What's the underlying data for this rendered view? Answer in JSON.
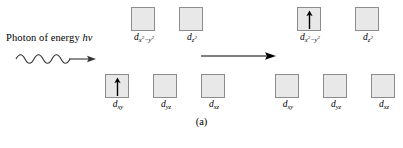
{
  "figure": {
    "caption": "(a)",
    "photon": {
      "text_plain": "Photon of energy ",
      "text_italic": "hv",
      "icon": "wavy-photon-arrow"
    },
    "reaction": {
      "icon": "right-arrow"
    },
    "colors": {
      "box_fill": "#e8e8e8",
      "box_border": "#8c8c8c",
      "ink": "#000000",
      "background": "#ffffff"
    },
    "panels": [
      {
        "name": "ground-state",
        "upper_level": [
          {
            "orbital": "d",
            "sub": "x",
            "sup1": "2",
            "dash": "−",
            "sub2": "y",
            "sup2": "2",
            "electrons": 0
          },
          {
            "orbital": "d",
            "sub": "z",
            "sup1": "2",
            "dash": "",
            "sub2": "",
            "sup2": "",
            "electrons": 0
          }
        ],
        "lower_level": [
          {
            "orbital": "d",
            "sub": "xy",
            "electrons": 1
          },
          {
            "orbital": "d",
            "sub": "yz",
            "electrons": 0
          },
          {
            "orbital": "d",
            "sub": "xz",
            "electrons": 0
          }
        ]
      },
      {
        "name": "excited-state",
        "upper_level": [
          {
            "orbital": "d",
            "sub": "x",
            "sup1": "2",
            "dash": "−",
            "sub2": "y",
            "sup2": "2",
            "electrons": 1
          },
          {
            "orbital": "d",
            "sub": "z",
            "sup1": "2",
            "dash": "",
            "sub2": "",
            "sup2": "",
            "electrons": 0
          }
        ],
        "lower_level": [
          {
            "orbital": "d",
            "sub": "xy",
            "electrons": 0
          },
          {
            "orbital": "d",
            "sub": "yz",
            "electrons": 0
          },
          {
            "orbital": "d",
            "sub": "xz",
            "electrons": 0
          }
        ]
      }
    ],
    "labels": {
      "L_upper_1": "x²−y²",
      "L_upper_2": "z²",
      "L_lower_1": "xy",
      "L_lower_2": "yz",
      "L_lower_3": "xz"
    }
  }
}
